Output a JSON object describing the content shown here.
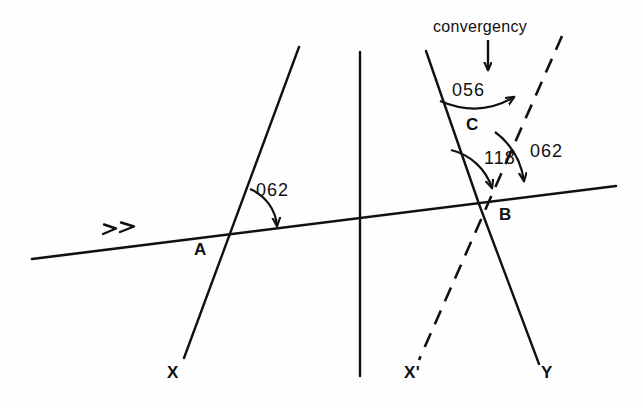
{
  "figure": {
    "type": "geometry-diagram",
    "background_color": "#fefefe",
    "ink_color": "#111111"
  },
  "caption": {
    "text": "convergency",
    "pointer_icon": "down-arrow-icon"
  },
  "angles": [
    {
      "id": "angle-at-a",
      "value": "062",
      "vertex": "A",
      "description": "bearing angle at A between meridian and line XY"
    },
    {
      "id": "angle-convergency",
      "value": "056",
      "vertex": "C",
      "description": "convergency angle between the two meridians"
    },
    {
      "id": "angle-118-at-b",
      "value": "118",
      "vertex": "B",
      "description": "angle at B between meridian BC and line BX-prime"
    },
    {
      "id": "angle-062-at-b",
      "value": "062",
      "vertex": "B",
      "description": "bearing angle at B between meridian and line XY"
    }
  ],
  "points": [
    {
      "id": "point-a",
      "label": "A"
    },
    {
      "id": "point-b",
      "label": "B"
    },
    {
      "id": "point-c",
      "label": "C"
    },
    {
      "id": "point-x",
      "label": "X"
    },
    {
      "id": "point-x-prime",
      "label": "X'"
    },
    {
      "id": "point-y",
      "label": "Y"
    }
  ],
  "lines": [
    {
      "id": "line-xy",
      "style": "solid",
      "marker": "double-chevron-direction-icon"
    },
    {
      "id": "meridian-through-a",
      "style": "solid"
    },
    {
      "id": "meridian-center",
      "style": "solid"
    },
    {
      "id": "meridian-through-b",
      "style": "solid"
    },
    {
      "id": "line-b-y",
      "style": "solid"
    },
    {
      "id": "line-x-prime-dashed",
      "style": "dashed"
    }
  ]
}
